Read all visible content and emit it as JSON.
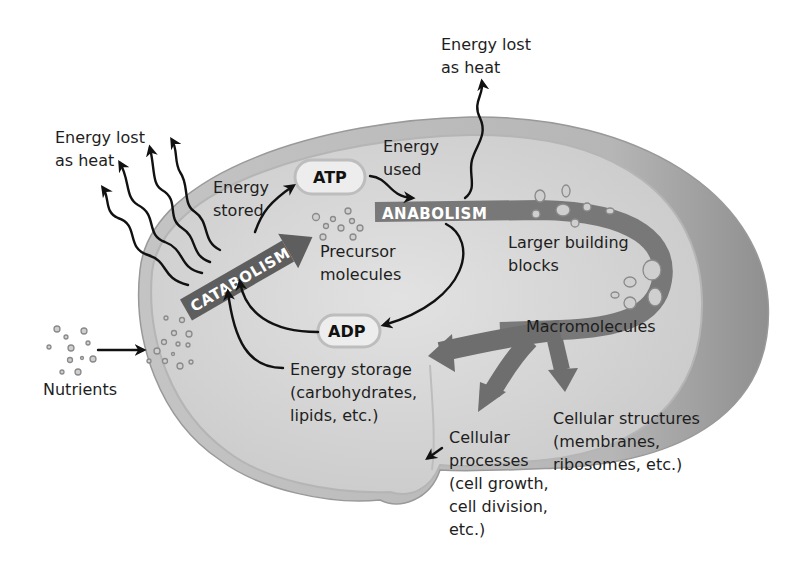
{
  "diagram": {
    "labels": {
      "heat_left": [
        "Energy lost",
        "as heat"
      ],
      "heat_top": [
        "Energy lost",
        "as heat"
      ],
      "energy_stored": [
        "Energy",
        "stored"
      ],
      "energy_used": [
        "Energy",
        "used"
      ],
      "atp": "ATP",
      "adp": "ADP",
      "catabolism": "CATABOLISM",
      "anabolism": "ANABOLISM",
      "precursor": [
        "Precursor",
        "molecules"
      ],
      "larger_blocks": [
        "Larger building",
        "blocks"
      ],
      "macromolecules": "Macromolecules",
      "nutrients": "Nutrients",
      "energy_storage": [
        "Energy storage",
        "(carbohydrates,",
        "lipids, etc.)"
      ],
      "cellular_structures": [
        "Cellular structures",
        "(membranes,",
        "ribosomes, etc.)"
      ],
      "cellular_processes": [
        "Cellular",
        "processes",
        "(cell growth,",
        "cell division,",
        "etc.)"
      ]
    },
    "colors": {
      "cell_outer": "#a9a9a9",
      "cell_inner": "#d6d6d6",
      "pathway_band": "#6e6e6e",
      "text": "#1e1e1e",
      "background": "#ffffff"
    }
  }
}
